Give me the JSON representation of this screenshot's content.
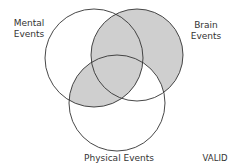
{
  "diagram": {
    "type": "venn-3",
    "circles": [
      {
        "id": "mental",
        "label_line1": "Mental",
        "label_line2": "Events",
        "cx": 94,
        "cy": 58,
        "r": 49
      },
      {
        "id": "brain",
        "label_line1": "Brain",
        "label_line2": "Events",
        "cx": 137,
        "cy": 55,
        "r": 46
      },
      {
        "id": "physical",
        "label": "Physical Events",
        "cx": 117,
        "cy": 103,
        "r": 48
      }
    ],
    "shaded_regions": [
      "brain-only",
      "mental-brain",
      "mental-physical",
      "all-three"
    ],
    "shade_color": "#cfcfcf",
    "stroke_color": "#333333",
    "verdict": "VALID"
  }
}
